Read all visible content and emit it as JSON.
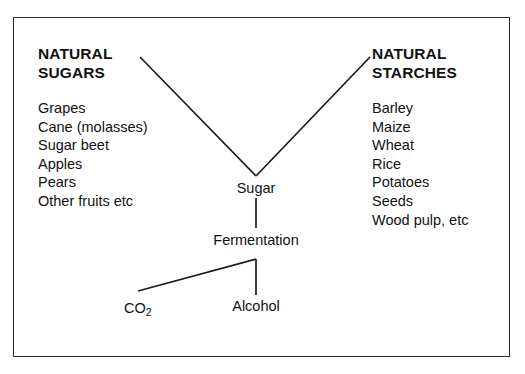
{
  "diagram": {
    "border_color": "#2a2a2a",
    "background_color": "#ffffff",
    "text_color": "#111111",
    "line_color": "#1a1a1a",
    "left_column": {
      "heading_line1": "NATURAL",
      "heading_line2": "SUGARS",
      "items": [
        "Grapes",
        "Cane (molasses)",
        "Sugar beet",
        "Apples",
        "Pears",
        "Other fruits etc"
      ]
    },
    "right_column": {
      "heading_line1": "NATURAL",
      "heading_line2": "STARCHES",
      "items": [
        "Barley",
        "Maize",
        "Wheat",
        "Rice",
        "Potatoes",
        "Seeds",
        "Wood pulp, etc"
      ]
    },
    "flow": {
      "sugar": "Sugar",
      "fermentation": "Fermentation",
      "alcohol": "Alcohol",
      "co2_base": "CO",
      "co2_subscript": "2"
    }
  }
}
